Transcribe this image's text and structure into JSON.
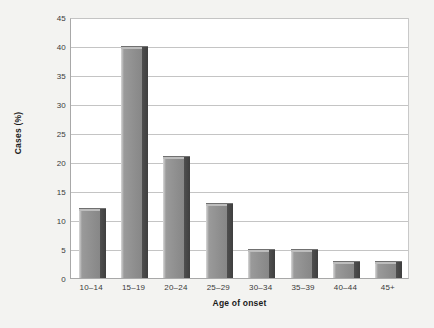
{
  "chart_data": {
    "type": "bar",
    "title": "",
    "xlabel": "Age of onset",
    "ylabel": "Cases (%)",
    "categories": [
      "10–14",
      "15–19",
      "20–24",
      "25–29",
      "30–34",
      "35–39",
      "40–44",
      "45+"
    ],
    "values": [
      12,
      40,
      21,
      13,
      5,
      5,
      3,
      3
    ],
    "ylim": [
      0,
      45
    ],
    "ytick_labels": [
      "0",
      "5",
      "10",
      "15",
      "20",
      "25",
      "30",
      "35",
      "40",
      "45"
    ],
    "ytick_values": [
      0,
      5,
      10,
      15,
      20,
      25,
      30,
      35,
      40,
      45
    ],
    "grid": "horizontal",
    "legend": "none",
    "series": [
      {
        "name": "Cases (%)",
        "values": [
          12,
          40,
          21,
          13,
          5,
          5,
          3,
          3
        ],
        "color": "#8d8d8d"
      }
    ],
    "colors": {
      "bar_fill": "#8d8d8d",
      "bar_shadow": "#434343",
      "bar_highlight": "#d8d8d8",
      "plot_background": "#ffffff",
      "figure_background": "#f3f3f1",
      "gridline": "#c4c4c4",
      "axis_line": "#a8a8a8",
      "text": "#3a3a3a"
    }
  }
}
